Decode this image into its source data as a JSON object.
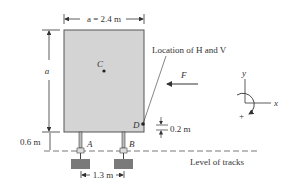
{
  "diagram": {
    "dimensions": {
      "width_label": "a = 2.4 m",
      "height_label": "a",
      "leg_height_label": "0.6 m",
      "support_spacing_label": "1.3 m",
      "offset_label": "0.2 m"
    },
    "points": {
      "center": "C",
      "left_support": "A",
      "right_support": "B",
      "load_point": "D"
    },
    "force": {
      "label": "F"
    },
    "annotations": {
      "location_note": "Location of H and V",
      "track_level": "Level of tracks"
    },
    "axes": {
      "y_label": "y",
      "x_label": "x",
      "moment_sign": "+"
    },
    "colors": {
      "box_fill": "#d4d4d4",
      "box_stroke": "#555555",
      "footing_fill": "#7a7a7a",
      "line": "#333333"
    }
  }
}
